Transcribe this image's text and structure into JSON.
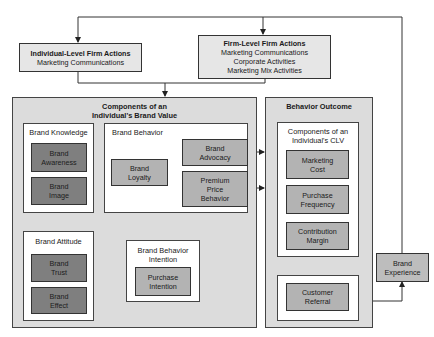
{
  "individual_actions": {
    "title": "Individual-Level Firm Actions",
    "items": [
      "Marketing Communications"
    ]
  },
  "firm_actions": {
    "title": "Firm-Level Firm Actions",
    "items": [
      "Marketing Communications",
      "Corporate Activities",
      "Marketing Mix Activities"
    ]
  },
  "brand_value": {
    "title_line1": "Components of an",
    "title_line2": "Individual's Brand Value",
    "brand_knowledge": {
      "title": "Brand Knowledge",
      "items": [
        {
          "line1": "Brand",
          "line2": "Awareness"
        },
        {
          "line1": "Brand",
          "line2": "Image"
        }
      ]
    },
    "brand_attitude": {
      "title": "Brand Attitude",
      "items": [
        {
          "line1": "Brand",
          "line2": "Trust"
        },
        {
          "line1": "Brand",
          "line2": "Effect"
        }
      ]
    },
    "brand_behavior": {
      "title": "Brand Behavior",
      "loyalty": {
        "line1": "Brand",
        "line2": "Loyalty"
      },
      "advocacy": {
        "line1": "Brand",
        "line2": "Advocacy"
      },
      "premium": {
        "line1": "Premium",
        "line2": "Price",
        "line3": "Behavior"
      }
    },
    "behavior_intention": {
      "title_line1": "Brand Behavior",
      "title_line2": "Intention",
      "purchase": {
        "line1": "Purchase",
        "line2": "Intention"
      }
    }
  },
  "behavior_outcome": {
    "title": "Behavior Outcome",
    "clv": {
      "title_line1": "Components of an",
      "title_line2": "Individual's CLV",
      "items": [
        {
          "line1": "Marketing",
          "line2": "Cost"
        },
        {
          "line1": "Purchase",
          "line2": "Frequency"
        },
        {
          "line1": "Contribution",
          "line2": "Margin"
        }
      ]
    },
    "referral": {
      "line1": "Customer",
      "line2": "Referral"
    }
  },
  "brand_experience": {
    "line1": "Brand",
    "line2": "Experience"
  },
  "colors": {
    "panel": "#dcdcdc",
    "dark_box": "#7f7f7f",
    "mid_box": "#b3b3b3",
    "line": "#333333"
  }
}
